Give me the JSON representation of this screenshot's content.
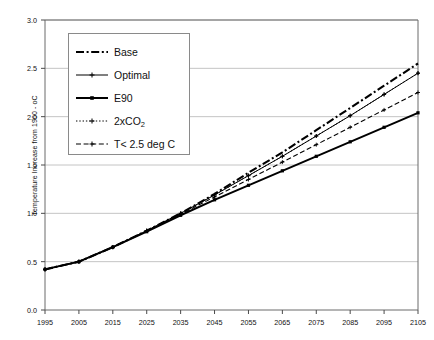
{
  "chart_data": {
    "type": "line",
    "title": "",
    "xlabel": "",
    "ylabel": "Temperature Increase from 1900 - oC",
    "xlim": [
      1995,
      2105
    ],
    "ylim": [
      0.0,
      3.0
    ],
    "grid": true,
    "legend_position": "upper-left-inside",
    "x": [
      1995,
      2005,
      2015,
      2025,
      2035,
      2045,
      2055,
      2065,
      2075,
      2085,
      2095,
      2105
    ],
    "xticks": [
      "1995",
      "2005",
      "2015",
      "2025",
      "2035",
      "2045",
      "2055",
      "2065",
      "2075",
      "2085",
      "2095",
      "2105"
    ],
    "yticks": [
      "0.0",
      "0.5",
      "1.0",
      "1.5",
      "2.0",
      "2.5",
      "3.0"
    ],
    "ytick_values": [
      0.0,
      0.5,
      1.0,
      1.5,
      2.0,
      2.5,
      3.0
    ],
    "series": [
      {
        "name": "Base",
        "style": "dash-dot",
        "marker": "none",
        "color": "#000000",
        "values": [
          0.42,
          0.5,
          0.65,
          0.82,
          1.0,
          1.2,
          1.42,
          1.63,
          1.86,
          2.09,
          2.32,
          2.55
        ]
      },
      {
        "name": "Optimal",
        "style": "solid-thin-marker",
        "marker": "cross",
        "color": "#000000",
        "values": [
          0.42,
          0.5,
          0.65,
          0.82,
          1.0,
          1.19,
          1.39,
          1.59,
          1.8,
          2.01,
          2.23,
          2.45
        ]
      },
      {
        "name": "E90",
        "style": "solid-thick",
        "marker": "square",
        "color": "#000000",
        "values": [
          0.42,
          0.5,
          0.65,
          0.81,
          0.98,
          1.14,
          1.29,
          1.44,
          1.59,
          1.74,
          1.89,
          2.04
        ]
      },
      {
        "name": "2xCO2",
        "style": "dotted",
        "marker": "cross",
        "color": "#000000",
        "values": [
          0.42,
          0.5,
          0.65,
          0.82,
          1.0,
          1.19,
          1.39,
          1.59,
          1.8,
          2.01,
          2.23,
          2.45
        ]
      },
      {
        "name": "T< 2.5 deg C",
        "style": "dashed",
        "marker": "cross",
        "color": "#000000",
        "values": [
          0.42,
          0.5,
          0.65,
          0.82,
          0.99,
          1.17,
          1.35,
          1.53,
          1.71,
          1.89,
          2.07,
          2.25
        ]
      }
    ]
  },
  "axes": {
    "y_title": "Temperature Increase from 1900 - oC",
    "y_labels": [
      "3.0",
      "2.5",
      "2.0",
      "1.5",
      "1.0",
      "0.5",
      "0.0"
    ],
    "x_labels": [
      "1995",
      "2005",
      "2015",
      "2025",
      "2035",
      "2045",
      "2055",
      "2065",
      "2075",
      "2085",
      "2095",
      "2105"
    ]
  },
  "legend": {
    "items": [
      {
        "label": "Base",
        "style": "dash-dot"
      },
      {
        "label": "Optimal",
        "style": "solid-thin-marker"
      },
      {
        "label": "E90",
        "style": "solid-thick"
      },
      {
        "label": "2xCO",
        "sub": "2",
        "style": "dotted"
      },
      {
        "label": "T< 2.5 deg C",
        "style": "dashed"
      }
    ]
  }
}
